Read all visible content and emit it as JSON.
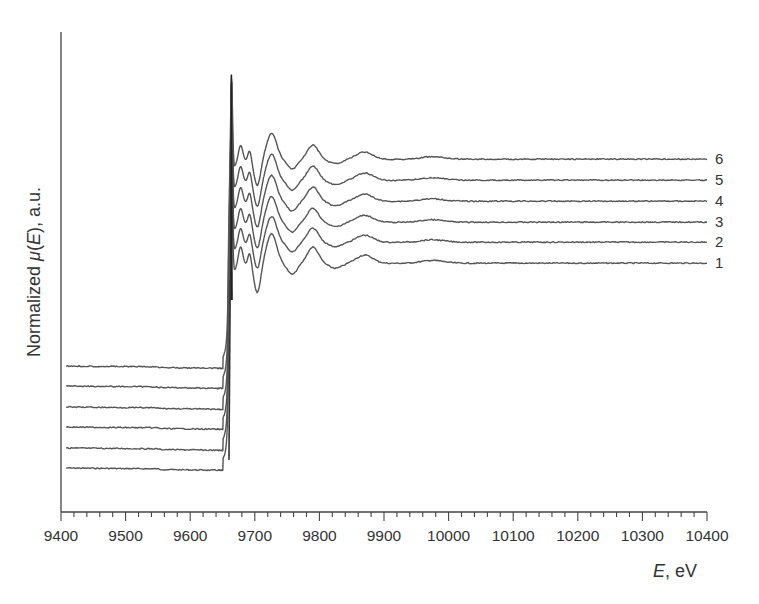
{
  "chart_data": {
    "type": "line",
    "title": "",
    "xlabel": "E, eV",
    "xlabel_parts": {
      "italic": "E",
      "rest": ", eV"
    },
    "ylabel": "Normalized μ(E), a.u.",
    "ylabel_parts": {
      "pre": "Normalized ",
      "italic_mu": "μ",
      "paren_open": "(",
      "italic_e": "E",
      "post": "), a.u."
    },
    "xlim": [
      9400,
      10400
    ],
    "ylim": null,
    "x_ticks_major": [
      9400,
      9500,
      9600,
      9700,
      9800,
      9900,
      10000,
      10100,
      10200,
      10300,
      10400
    ],
    "x_tick_labels": [
      "9400",
      "9500",
      "9600",
      "9700",
      "9800",
      "9900",
      "10000",
      "10100",
      "10200",
      "10300",
      "10400"
    ],
    "x_minor_step": 20,
    "y_ticks": [],
    "grid": false,
    "legend": "inline curve labels at right end",
    "stacked_offset": true,
    "edge_energy_eV": 9660,
    "white_line_peak_eV": 9665,
    "exafs_features_eV": [
      9680,
      9695,
      9725,
      9790,
      9870,
      9975
    ],
    "series": [
      {
        "name": "1",
        "label": "1",
        "pre_edge_level_px": 468,
        "post_edge_level_px": 263
      },
      {
        "name": "2",
        "label": "2",
        "pre_edge_level_px": 448,
        "post_edge_level_px": 242
      },
      {
        "name": "3",
        "label": "3",
        "pre_edge_level_px": 427,
        "post_edge_level_px": 222
      },
      {
        "name": "4",
        "label": "4",
        "pre_edge_level_px": 407,
        "post_edge_level_px": 201
      },
      {
        "name": "5",
        "label": "5",
        "pre_edge_level_px": 386,
        "post_edge_level_px": 180
      },
      {
        "name": "6",
        "label": "6",
        "pre_edge_level_px": 366,
        "post_edge_level_px": 159
      }
    ]
  },
  "colors": {
    "curve": "#555555",
    "axis": "#444444",
    "text": "#333333",
    "background": "#ffffff"
  }
}
